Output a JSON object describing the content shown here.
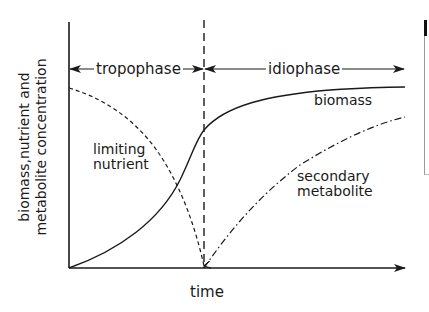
{
  "diagram": {
    "type": "growth-phase-curves",
    "phases": [
      {
        "label": "tropophase",
        "x_start": 69,
        "x_end": 204
      },
      {
        "label": "idiophase",
        "x_start": 204,
        "x_end": 405
      }
    ],
    "axes": {
      "x_label": "time",
      "y_label_line1": "biomass,nutrient and",
      "y_label_line2": "metabolite concentration"
    },
    "curves": [
      {
        "name": "biomass",
        "label": "biomass",
        "style": "solid"
      },
      {
        "name": "limiting-nutrient",
        "label_line1": "limiting",
        "label_line2": "nutrient",
        "style": "dashed"
      },
      {
        "name": "secondary-metabolite",
        "label_line1": "secondary",
        "label_line2": "metabolite",
        "style": "dash-dot"
      }
    ],
    "phase_boundary_style": "dashed-vertical",
    "colors": {
      "ink": "#1a1a1a",
      "background": "#ffffff"
    }
  }
}
